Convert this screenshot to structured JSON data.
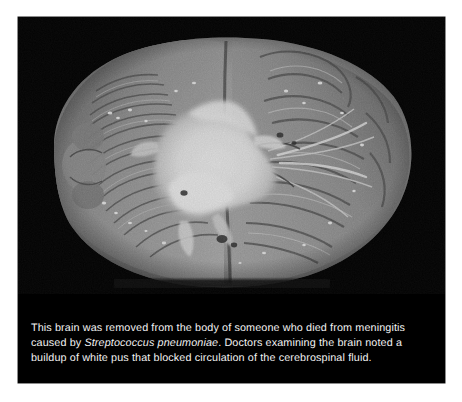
{
  "figure": {
    "photo": {
      "alt_description": "Grayscale photograph of a human brain specimen viewed from below, resting on a black background, showing thick white pus covering the midline structures",
      "subject": "human brain specimen",
      "background_color": "#000000",
      "modality": "grayscale photograph"
    },
    "caption": {
      "segment_1": "This brain was removed from the body of someone who died from meningitis caused by ",
      "species_italic": "Streptococcus pneumoniae",
      "segment_2": ". Doctors examining the brain noted a buildup of white pus that blocked circulation of the cerebrospinal fluid.",
      "text_color": "#f2f2f2"
    }
  }
}
